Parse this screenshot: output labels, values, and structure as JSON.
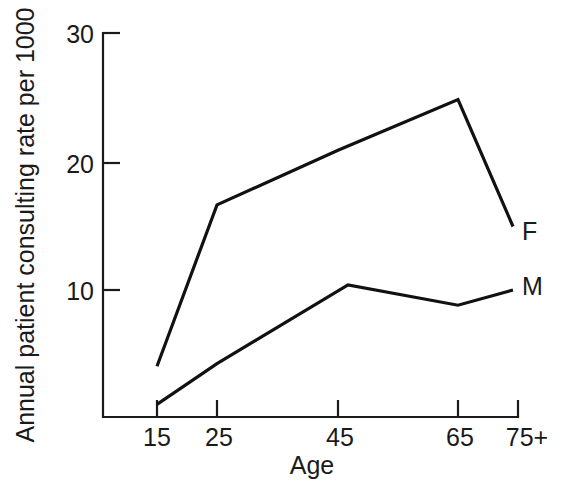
{
  "chart_data": {
    "type": "line",
    "title": "",
    "subtitle": "",
    "xlabel": "Age",
    "ylabel": "Annual patient consulting rate per 1000",
    "x_tick_labels": [
      "15",
      "25",
      "45",
      "65",
      "75+"
    ],
    "x_tick_values": [
      15,
      25,
      45,
      65,
      75
    ],
    "y_tick_labels": [
      "10",
      "20",
      "30"
    ],
    "y_tick_values": [
      10,
      20,
      30
    ],
    "ylim": [
      0,
      30
    ],
    "grid": false,
    "legend_position": "right-of-line-ends",
    "series": [
      {
        "name": "F",
        "label": "F",
        "color": "#111111",
        "x": [
          15,
          25,
          45,
          65,
          75
        ],
        "values": [
          4.0,
          16.7,
          21.0,
          25.0,
          15.0
        ]
      },
      {
        "name": "M",
        "label": "M",
        "color": "#111111",
        "x": [
          15,
          25,
          45,
          65,
          75
        ],
        "values": [
          1.0,
          4.2,
          10.4,
          8.8,
          10.0
        ]
      }
    ],
    "annotations": [
      {
        "text": "F",
        "series": "F",
        "at_x": 75
      },
      {
        "text": "M",
        "series": "M",
        "at_x": 75
      }
    ]
  },
  "axes": {
    "y_title": "Annual patient consulting rate per 1000",
    "x_title": "Age",
    "y_ticks": [
      {
        "label": "30",
        "value": 30
      },
      {
        "label": "20",
        "value": 20
      },
      {
        "label": "10",
        "value": 10
      }
    ],
    "x_ticks": [
      {
        "label": "15",
        "value": 15
      },
      {
        "label": "25",
        "value": 25
      },
      {
        "label": "45",
        "value": 45
      },
      {
        "label": "65",
        "value": 65
      },
      {
        "label": "75+",
        "value": 75
      }
    ]
  },
  "series_labels": {
    "female": "F",
    "male": "M"
  },
  "colors": {
    "background": "#ffffff",
    "ink": "#1a1a1a",
    "line": "#111111"
  }
}
